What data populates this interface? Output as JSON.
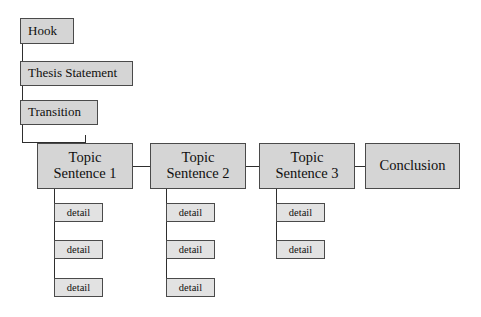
{
  "diagram": {
    "type": "flowchart",
    "background_color": "#ffffff",
    "node_fill_color": "#d5d5d5",
    "detail_fill_color": "#e2e2e2",
    "border_color": "#4a4a4a",
    "connector_color": "#2e2e2e",
    "intro_nodes": [
      {
        "label": "Hook",
        "x": 20,
        "y": 18,
        "w": 54,
        "h": 26
      },
      {
        "label": "Thesis Statement",
        "x": 20,
        "y": 61,
        "w": 113,
        "h": 25
      },
      {
        "label": "Transition",
        "x": 20,
        "y": 100,
        "w": 78,
        "h": 25
      }
    ],
    "body_nodes": [
      {
        "label": "Topic\nSentence 1",
        "x": 37,
        "y": 143,
        "w": 96,
        "h": 46
      },
      {
        "label": "Topic\nSentence 2",
        "x": 150,
        "y": 143,
        "w": 96,
        "h": 46
      },
      {
        "label": "Topic\nSentence 3",
        "x": 259,
        "y": 143,
        "w": 96,
        "h": 46
      },
      {
        "label": "Conclusion",
        "x": 365,
        "y": 143,
        "w": 95,
        "h": 46
      }
    ],
    "detail_columns": [
      {
        "parent": "Topic Sentence 1",
        "stem_x": 54,
        "details": [
          {
            "label": "detail",
            "x": 54,
            "y": 203,
            "w": 49,
            "h": 19
          },
          {
            "label": "detail",
            "x": 54,
            "y": 240,
            "w": 49,
            "h": 19
          },
          {
            "label": "detail",
            "x": 54,
            "y": 278,
            "w": 49,
            "h": 19
          }
        ]
      },
      {
        "parent": "Topic Sentence 2",
        "stem_x": 166,
        "details": [
          {
            "label": "detail",
            "x": 166,
            "y": 203,
            "w": 49,
            "h": 19
          },
          {
            "label": "detail",
            "x": 166,
            "y": 240,
            "w": 49,
            "h": 19
          },
          {
            "label": "detail",
            "x": 166,
            "y": 278,
            "w": 49,
            "h": 19
          }
        ]
      },
      {
        "parent": "Topic Sentence 3",
        "stem_x": 276,
        "details": [
          {
            "label": "detail",
            "x": 276,
            "y": 203,
            "w": 49,
            "h": 19
          },
          {
            "label": "detail",
            "x": 276,
            "y": 240,
            "w": 49,
            "h": 19
          }
        ]
      }
    ],
    "connectors": [
      {
        "id": "hook-to-thesis",
        "orient": "v",
        "x": 22,
        "y": 44,
        "len": 18
      },
      {
        "id": "thesis-to-transition",
        "orient": "v",
        "x": 22,
        "y": 86,
        "len": 15
      },
      {
        "id": "transition-down",
        "orient": "v",
        "x": 22,
        "y": 125,
        "len": 18
      },
      {
        "id": "transition-across",
        "orient": "h",
        "x": 22,
        "y": 142,
        "len": 63
      },
      {
        "id": "transition-to-topic1",
        "orient": "v",
        "x": 85,
        "y": 135,
        "len": 8
      },
      {
        "id": "topic1-to-topic2",
        "orient": "h",
        "x": 133,
        "y": 166,
        "len": 17
      },
      {
        "id": "topic2-to-topic3",
        "orient": "h",
        "x": 246,
        "y": 166,
        "len": 13
      },
      {
        "id": "topic3-to-conclusion",
        "orient": "h",
        "x": 355,
        "y": 166,
        "len": 10
      },
      {
        "id": "topic1-stem",
        "orient": "v",
        "x": 54,
        "y": 189,
        "len": 101
      },
      {
        "id": "topic2-stem",
        "orient": "v",
        "x": 166,
        "y": 189,
        "len": 101
      },
      {
        "id": "topic3-stem",
        "orient": "v",
        "x": 276,
        "y": 189,
        "len": 63
      },
      {
        "id": "topic1-detail1-tick",
        "orient": "h",
        "x": 54,
        "y": 212,
        "len": 1
      },
      {
        "id": "topic2-detail1-tick",
        "orient": "h",
        "x": 166,
        "y": 212,
        "len": 1
      },
      {
        "id": "topic3-detail1-tick",
        "orient": "h",
        "x": 276,
        "y": 212,
        "len": 1
      }
    ]
  }
}
